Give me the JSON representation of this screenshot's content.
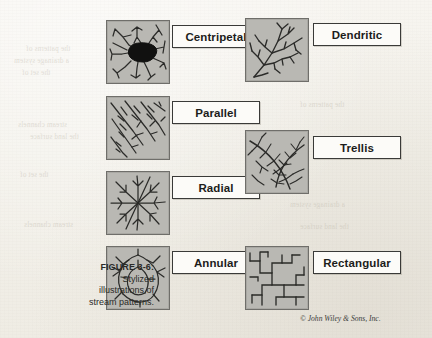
{
  "figure": {
    "number": "FIGURE 3-6:",
    "caption_line1": "Stylized",
    "caption_line2": "illustrations of",
    "caption_line3": "stream patterns.",
    "copyright": "© John Wiley & Sons, Inc."
  },
  "colors": {
    "page_background": "#f6f4ef",
    "panel_fill": "#b9b8b3",
    "panel_border": "#6f6e6a",
    "stream_line": "#2b2b29",
    "basin_fill": "#111110",
    "label_background": "#fcfbf8",
    "label_border": "#3a3a38",
    "text": "#1d1d1b"
  },
  "panels": [
    {
      "id": "centripetal",
      "label": "Centripetal",
      "description": "Streams converge inward toward a central dark basin",
      "column": "left",
      "panel_x": 106,
      "panel_y": 20,
      "panel_size": 62,
      "label_x": 172,
      "label_y": 25,
      "label_width": 86
    },
    {
      "id": "parallel",
      "label": "Parallel",
      "description": "Streams run in parallel diagonal courses down a uniform slope",
      "column": "left",
      "panel_x": 106,
      "panel_y": 96,
      "panel_size": 62,
      "label_x": 172,
      "label_y": 101,
      "label_width": 86
    },
    {
      "id": "radial",
      "label": "Radial",
      "description": "Streams radiate outward from a central high point",
      "column": "left",
      "panel_x": 106,
      "panel_y": 171,
      "panel_size": 62,
      "label_x": 172,
      "label_y": 176,
      "label_width": 86
    },
    {
      "id": "annular",
      "label": "Annular",
      "description": "Streams form concentric ring-like courses around a dome",
      "column": "left",
      "panel_x": 106,
      "panel_y": 246,
      "panel_size": 62,
      "label_x": 172,
      "label_y": 251,
      "label_width": 86
    },
    {
      "id": "dendritic",
      "label": "Dendritic",
      "description": "Tree-like branching stream network",
      "column": "right",
      "panel_x": 245,
      "panel_y": 18,
      "panel_size": 62,
      "label_x": 313,
      "label_y": 23,
      "label_width": 86
    },
    {
      "id": "trellis",
      "label": "Trellis",
      "description": "Main trunk streams with short perpendicular tributaries",
      "column": "right",
      "panel_x": 245,
      "panel_y": 130,
      "panel_size": 62,
      "label_x": 313,
      "label_y": 136,
      "label_width": 86
    },
    {
      "id": "rectangular",
      "label": "Rectangular",
      "description": "Streams joining at right angles along fracture lines",
      "column": "right",
      "panel_x": 245,
      "panel_y": 246,
      "panel_size": 62,
      "label_x": 313,
      "label_y": 251,
      "label_width": 86
    }
  ],
  "background_text": {
    "note": "faint show-through text from reverse of page, illegible",
    "lines": [
      "the patterns of",
      "a drainage system",
      "the set of",
      "stream channels",
      "the land surface"
    ]
  }
}
